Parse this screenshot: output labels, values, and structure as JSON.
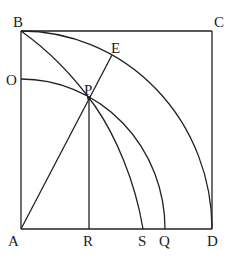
{
  "diagram": {
    "type": "geometry",
    "labels": {
      "A": "A",
      "B": "B",
      "C": "C",
      "D": "D",
      "E": "E",
      "O": "O",
      "P": "P",
      "R": "R",
      "S": "S",
      "Q": "Q"
    },
    "points": {
      "A": [
        21,
        229
      ],
      "B": [
        21,
        31
      ],
      "C": [
        212,
        31
      ],
      "D": [
        212,
        229
      ],
      "E": [
        112,
        55
      ],
      "O": [
        21,
        79
      ],
      "P": [
        89,
        98
      ],
      "R": [
        89,
        229
      ],
      "S": [
        143,
        229
      ],
      "Q": [
        165,
        229
      ]
    },
    "segments": [
      "AB",
      "BC",
      "CD",
      "AD",
      "AE",
      "PR"
    ],
    "arcs": [
      "BED (center A)",
      "OPQ (center A)",
      "BPS (curve)"
    ]
  }
}
